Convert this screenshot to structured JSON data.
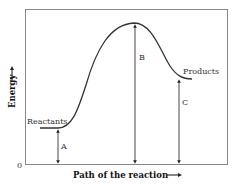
{
  "diagram": {
    "type": "energy-profile",
    "x_axis_label": "Path of the reaction",
    "y_axis_label": "Energy",
    "origin_label": "0",
    "curve_labels": {
      "start": "Reactants",
      "end": "Products"
    },
    "arrow_labels": {
      "a": "A",
      "b": "B",
      "c": "C"
    },
    "colors": {
      "line": "#333333",
      "frame": "#666666",
      "background": "#ffffff"
    }
  }
}
